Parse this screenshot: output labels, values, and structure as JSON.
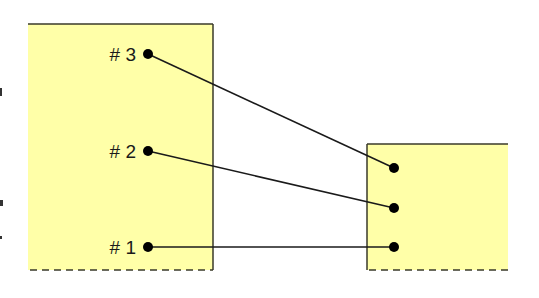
{
  "diagram": {
    "colors": {
      "box_fill": "#ffffa8",
      "box_stroke": "#3a3a2a",
      "line": "#1a1a1a",
      "dot": "#000000",
      "background": "#ffffff"
    },
    "left_box": {
      "x": 28,
      "y": 24,
      "width": 185,
      "height": 246
    },
    "right_box": {
      "x": 367,
      "y": 144,
      "width": 141,
      "height": 126
    },
    "ports": [
      {
        "label": "# 3",
        "left": {
          "x": 148,
          "y": 54
        },
        "right": {
          "x": 394,
          "y": 168
        }
      },
      {
        "label": "# 2",
        "left": {
          "x": 148,
          "y": 151
        },
        "right": {
          "x": 394,
          "y": 208
        }
      },
      {
        "label": "# 1",
        "left": {
          "x": 148,
          "y": 247
        },
        "right": {
          "x": 394,
          "y": 247
        }
      }
    ]
  }
}
